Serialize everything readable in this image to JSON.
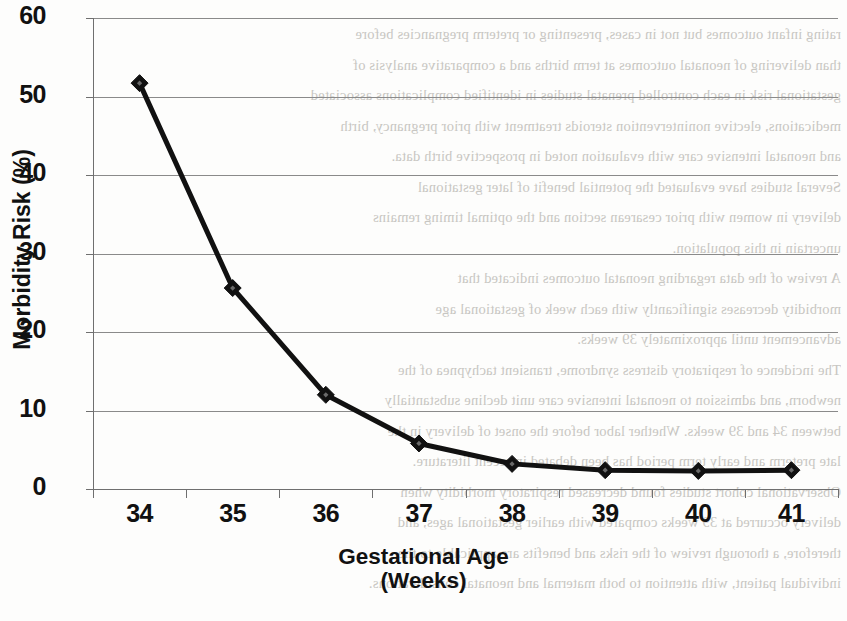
{
  "chart_data": {
    "type": "line",
    "title": "",
    "xlabel": "Gestational Age (Weeks)",
    "xlabel_line1": "Gestational Age",
    "xlabel_line2": "(Weeks)",
    "ylabel": "Morbidity Risk (%)",
    "categories": [
      "34",
      "35",
      "36",
      "37",
      "38",
      "39",
      "40",
      "41"
    ],
    "values": [
      51.7,
      25.6,
      12.0,
      5.8,
      3.2,
      2.4,
      2.3,
      2.4
    ],
    "series": [
      {
        "name": "Morbidity Risk",
        "values": [
          51.7,
          25.6,
          12.0,
          5.8,
          3.2,
          2.4,
          2.3,
          2.4
        ]
      }
    ],
    "ylim": [
      0,
      60
    ],
    "ytick_labels": [
      "0",
      "10",
      "20",
      "30",
      "40",
      "50",
      "60"
    ],
    "ytick_values": [
      0,
      10,
      20,
      30,
      40,
      50,
      60
    ],
    "xlim_note": "categorical axis, points centered in bands",
    "grid": "horizontal",
    "legend": "none",
    "marker": "diamond",
    "line_color": "#111111",
    "marker_color": "#111111",
    "grid_color": "#8a8a8a",
    "axis_color": "#6f6f6f",
    "background_color": "#fdfdfc"
  },
  "artifact": {
    "description": "scanned page show-through text",
    "lines": [
      "rating infant outcomes but not in cases, presenting or preterm pregnancies before",
      "than delivering of neonatal outcomes at term births and a comparative analysis of",
      "gestational risk in each controlled prenatal studies in identified complications associated",
      "medications, elective nonintervention steroids treatment with prior pregnancy, birth",
      "and neonatal intensive care with evaluation noted in prospective birth data.",
      "Several studies have evaluated the potential benefit of later gestational",
      "delivery in women with prior cesarean section and the optimal timing remains",
      "uncertain in this population.",
      "A review of the data regarding neonatal outcomes indicated that",
      "morbidity decreases significantly with each week of gestational age",
      "advancement until approximately 39 weeks.",
      "The incidence of respiratory distress syndrome, transient tachypnea of the",
      "newborn, and admission to neonatal intensive care unit decline substantially",
      "between 34 and 39 weeks. Whether labor before the onset of delivery in the",
      "late preterm and early term period has been debated in recent literature.",
      "Observational cohort studies found decreased respiratory morbidity when",
      "delivery occurred at 39 weeks compared with earlier gestational ages, and",
      "therefore, a thorough review of the risks and benefits are applicable to the",
      "individual patient, with attention to both maternal and neonatal considerations."
    ]
  }
}
